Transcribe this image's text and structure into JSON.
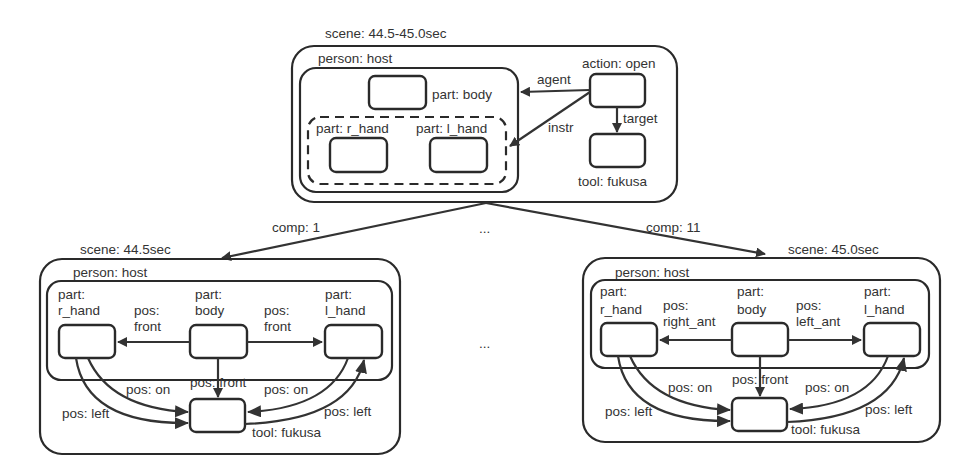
{
  "top_scene": {
    "scene_label": "scene: 44.5-45.0sec",
    "person_label": "person: host",
    "part_body": "part: body",
    "part_r_hand": "part: r_hand",
    "part_l_hand": "part: l_hand",
    "action_label": "action: open",
    "tool_label": "tool: fukusa",
    "edge_agent": "agent",
    "edge_instr": "instr",
    "edge_target": "target"
  },
  "composition": {
    "left_label": "comp: 1",
    "right_label": "comp: 11",
    "ellipsis": "..."
  },
  "left_scene": {
    "scene_label": "scene: 44.5sec",
    "person_label": "person: host",
    "r_hand_l1": "part:",
    "r_hand_l2": "r_hand",
    "body_l1": "part:",
    "body_l2": "body",
    "l_hand_l1": "part:",
    "l_hand_l2": "l_hand",
    "pos_to_r_hand_l1": "pos:",
    "pos_to_r_hand_l2": "front",
    "pos_to_l_hand_l1": "pos:",
    "pos_to_l_hand_l2": "front",
    "pos_body_tool": "pos: front",
    "pos_r_on": "pos: on",
    "pos_l_on": "pos: on",
    "pos_r_left": "pos: left",
    "pos_l_left": "pos: left",
    "tool_label": "tool: fukusa"
  },
  "right_scene": {
    "scene_label": "scene: 45.0sec",
    "person_label": "person: host",
    "r_hand_l1": "part:",
    "r_hand_l2": "r_hand",
    "body_l1": "part:",
    "body_l2": "body",
    "l_hand_l1": "part:",
    "l_hand_l2": "l_hand",
    "pos_to_r_hand_l1": "pos:",
    "pos_to_r_hand_l2": "right_ant",
    "pos_to_l_hand_l1": "pos:",
    "pos_to_l_hand_l2": "left_ant",
    "pos_body_tool": "pos: front",
    "pos_r_on": "pos: on",
    "pos_l_on": "pos: on",
    "pos_r_left": "pos: left",
    "pos_l_left": "pos: left",
    "tool_label": "tool: fukusa"
  }
}
